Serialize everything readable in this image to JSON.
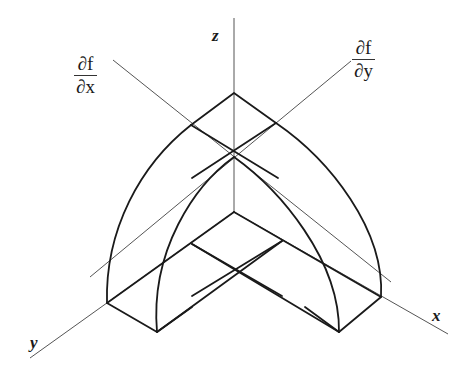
{
  "diagram": {
    "type": "isometric 3D surface sketch",
    "axes": {
      "x": {
        "label": "x"
      },
      "y": {
        "label": "y"
      },
      "z": {
        "label": "z"
      }
    },
    "partials": {
      "df_dx": {
        "numerator": "∂f",
        "denominator": "∂x"
      },
      "df_dy": {
        "numerator": "∂f",
        "denominator": "∂y"
      }
    },
    "colors": {
      "ink": "#1a1a1a",
      "thin_line": "#555555",
      "background": "#ffffff"
    }
  }
}
